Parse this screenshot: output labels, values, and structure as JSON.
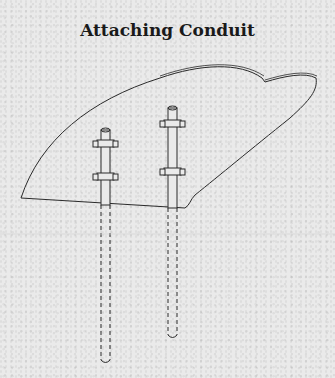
{
  "title": "Attaching Conduit",
  "colors": {
    "line": "#2a2a2a",
    "background": "#eaeaea"
  }
}
